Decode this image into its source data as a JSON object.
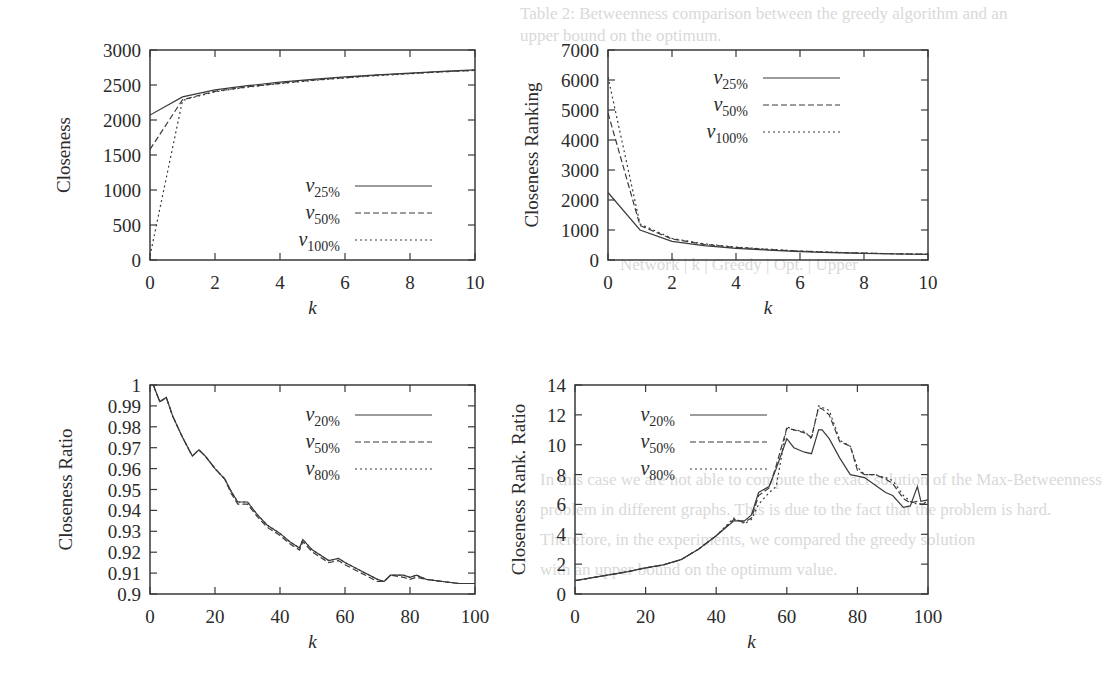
{
  "background_text": [
    {
      "text": "Table 2: Betweenness comparison between the greedy algorithm and an",
      "x": 520,
      "y": 4
    },
    {
      "text": "upper bound on the optimum.",
      "x": 520,
      "y": 26
    },
    {
      "text": "Network | k | Greedy | Opt. | Upper",
      "x": 620,
      "y": 255
    },
    {
      "text": "In this case we are not able to compute the exact solution of the Max-Betweenness",
      "x": 540,
      "y": 470
    },
    {
      "text": "problem in different graphs. This is due to the fact that the problem is hard.",
      "x": 540,
      "y": 500
    },
    {
      "text": "Therefore, in the experiments, we compared the greedy solution",
      "x": 540,
      "y": 530
    },
    {
      "text": "with an upper bound on the optimum value.",
      "x": 540,
      "y": 560
    }
  ],
  "chart_data": [
    {
      "id": "closeness",
      "type": "line",
      "title": "",
      "xlabel": "k",
      "ylabel": "Closeness",
      "xlim": [
        0,
        10
      ],
      "ylim": [
        0,
        3000
      ],
      "xticks": [
        0,
        2,
        4,
        6,
        8,
        10
      ],
      "yticks": [
        0,
        500,
        1000,
        1500,
        2000,
        2500,
        3000
      ],
      "grid": false,
      "legend_position": "lower-right",
      "frame": {
        "x0": 150,
        "y0": 50,
        "x1": 475,
        "y1": 260
      },
      "x": [
        0,
        1,
        2,
        3,
        4,
        5,
        6,
        7,
        8,
        9,
        10
      ],
      "series": [
        {
          "name": "v25%",
          "base": "v",
          "sub": "25%",
          "style": "solid",
          "values": [
            2070,
            2330,
            2430,
            2490,
            2540,
            2580,
            2615,
            2645,
            2670,
            2695,
            2715
          ]
        },
        {
          "name": "v50%",
          "base": "v",
          "sub": "50%",
          "style": "dashed",
          "values": [
            1580,
            2290,
            2410,
            2475,
            2525,
            2570,
            2605,
            2640,
            2665,
            2690,
            2710
          ]
        },
        {
          "name": "v100%",
          "base": "v",
          "sub": "100%",
          "style": "dotted",
          "values": [
            60,
            2280,
            2405,
            2470,
            2520,
            2565,
            2600,
            2635,
            2660,
            2688,
            2708
          ]
        }
      ]
    },
    {
      "id": "closeness-ranking",
      "type": "line",
      "title": "",
      "xlabel": "k",
      "ylabel": "Closeness Ranking",
      "xlim": [
        0,
        10
      ],
      "ylim": [
        0,
        7000
      ],
      "xticks": [
        0,
        2,
        4,
        6,
        8,
        10
      ],
      "yticks": [
        0,
        1000,
        2000,
        3000,
        4000,
        5000,
        6000,
        7000
      ],
      "grid": false,
      "legend_position": "upper-right",
      "frame": {
        "x0": 608,
        "y0": 50,
        "x1": 928,
        "y1": 260
      },
      "x": [
        0,
        1,
        2,
        3,
        4,
        5,
        6,
        7,
        8,
        9,
        10
      ],
      "series": [
        {
          "name": "v25%",
          "base": "v",
          "sub": "25%",
          "style": "solid",
          "values": [
            2250,
            1000,
            620,
            480,
            390,
            330,
            280,
            245,
            220,
            200,
            185
          ]
        },
        {
          "name": "v50%",
          "base": "v",
          "sub": "50%",
          "style": "dashed",
          "values": [
            4900,
            1150,
            700,
            520,
            420,
            350,
            295,
            255,
            228,
            205,
            190
          ]
        },
        {
          "name": "v100%",
          "base": "v",
          "sub": "100%",
          "style": "dotted",
          "values": [
            6100,
            1200,
            720,
            540,
            430,
            360,
            300,
            260,
            230,
            208,
            192
          ]
        }
      ]
    },
    {
      "id": "closeness-ratio",
      "type": "line",
      "title": "",
      "xlabel": "k",
      "ylabel": "Closeness Ratio",
      "xlim": [
        0,
        100
      ],
      "ylim": [
        0.9,
        1.0
      ],
      "xticks": [
        0,
        20,
        40,
        60,
        80,
        100
      ],
      "yticks": [
        0.9,
        0.91,
        0.92,
        0.93,
        0.94,
        0.95,
        0.96,
        0.97,
        0.98,
        0.99,
        1
      ],
      "ytick_labels": [
        "0.9",
        "0.91",
        "0.92",
        "0.93",
        "0.94",
        "0.95",
        "0.96",
        "0.97",
        "0.98",
        "0.99",
        "1"
      ],
      "grid": false,
      "legend_position": "upper-right",
      "frame": {
        "x0": 150,
        "y0": 385,
        "x1": 475,
        "y1": 594
      },
      "x": [
        1,
        3,
        5,
        7,
        10,
        13,
        15,
        17,
        20,
        23,
        25,
        27,
        30,
        33,
        36,
        40,
        43,
        46,
        47,
        50,
        55,
        58,
        60,
        65,
        70,
        72,
        74,
        78,
        80,
        82,
        85,
        90,
        95,
        100
      ],
      "series": [
        {
          "name": "v20%",
          "base": "v",
          "sub": "20%",
          "style": "solid",
          "values": [
            1.0,
            0.992,
            0.994,
            0.985,
            0.975,
            0.966,
            0.969,
            0.966,
            0.96,
            0.955,
            0.949,
            0.944,
            0.944,
            0.938,
            0.933,
            0.929,
            0.925,
            0.922,
            0.926,
            0.921,
            0.916,
            0.917,
            0.915,
            0.911,
            0.907,
            0.906,
            0.909,
            0.909,
            0.908,
            0.909,
            0.907,
            0.906,
            0.905,
            0.905
          ]
        },
        {
          "name": "v50%",
          "base": "v",
          "sub": "50%",
          "style": "dashed",
          "values": [
            1.0,
            0.992,
            0.994,
            0.985,
            0.975,
            0.966,
            0.969,
            0.966,
            0.96,
            0.955,
            0.948,
            0.943,
            0.943,
            0.937,
            0.932,
            0.928,
            0.924,
            0.921,
            0.925,
            0.92,
            0.915,
            0.916,
            0.914,
            0.91,
            0.906,
            0.906,
            0.909,
            0.908,
            0.907,
            0.908,
            0.907,
            0.906,
            0.905,
            0.905
          ]
        },
        {
          "name": "v80%",
          "base": "v",
          "sub": "80%",
          "style": "dotted",
          "values": [
            1.0,
            0.992,
            0.994,
            0.985,
            0.975,
            0.966,
            0.969,
            0.966,
            0.96,
            0.955,
            0.949,
            0.944,
            0.944,
            0.938,
            0.933,
            0.929,
            0.925,
            0.922,
            0.926,
            0.921,
            0.916,
            0.917,
            0.915,
            0.911,
            0.907,
            0.906,
            0.909,
            0.909,
            0.908,
            0.909,
            0.907,
            0.906,
            0.905,
            0.905
          ]
        }
      ]
    },
    {
      "id": "closeness-rank-ratio",
      "type": "line",
      "title": "",
      "xlabel": "k",
      "ylabel": "Closeness Rank. Ratio",
      "xlim": [
        0,
        100
      ],
      "ylim": [
        0,
        14
      ],
      "xticks": [
        0,
        20,
        40,
        60,
        80,
        100
      ],
      "yticks": [
        0,
        2,
        4,
        6,
        8,
        10,
        12,
        14
      ],
      "grid": false,
      "legend_position": "upper-left",
      "frame": {
        "x0": 575,
        "y0": 385,
        "x1": 928,
        "y1": 594
      },
      "x": [
        0,
        5,
        10,
        15,
        20,
        25,
        30,
        35,
        40,
        45,
        48,
        50,
        52,
        55,
        57,
        60,
        62,
        65,
        67,
        69,
        70,
        72,
        75,
        78,
        80,
        82,
        85,
        88,
        90,
        93,
        95,
        97,
        98,
        100
      ],
      "series": [
        {
          "name": "v20%",
          "base": "v",
          "sub": "20%",
          "style": "solid",
          "values": [
            0.9,
            1.1,
            1.3,
            1.5,
            1.75,
            1.95,
            2.3,
            3.0,
            3.9,
            4.9,
            4.9,
            5.3,
            6.8,
            7.2,
            8.4,
            10.4,
            9.8,
            9.5,
            9.4,
            11.0,
            11.0,
            10.4,
            9.1,
            8.0,
            7.9,
            7.8,
            7.3,
            6.8,
            6.6,
            5.8,
            5.9,
            7.2,
            6.2,
            6.3
          ]
        },
        {
          "name": "v50%",
          "base": "v",
          "sub": "50%",
          "style": "dashed",
          "values": [
            0.9,
            1.1,
            1.3,
            1.5,
            1.75,
            1.95,
            2.3,
            3.0,
            3.9,
            5.0,
            4.8,
            5.1,
            6.6,
            7.1,
            8.6,
            11.1,
            11.0,
            10.8,
            10.5,
            12.5,
            12.4,
            12.0,
            10.2,
            9.9,
            8.3,
            8.0,
            8.0,
            7.7,
            7.4,
            6.4,
            6.1,
            6.2,
            6.0,
            6.1
          ]
        },
        {
          "name": "v80%",
          "base": "v",
          "sub": "80%",
          "style": "dotted",
          "values": [
            0.9,
            1.1,
            1.3,
            1.5,
            1.75,
            1.95,
            2.3,
            3.0,
            3.9,
            5.1,
            4.7,
            5.0,
            6.0,
            6.8,
            7.2,
            11.2,
            11.0,
            10.9,
            10.4,
            12.6,
            12.5,
            12.3,
            10.3,
            9.9,
            8.5,
            8.0,
            8.0,
            7.8,
            7.6,
            6.6,
            6.2,
            6.0,
            6.0,
            6.2
          ]
        }
      ]
    }
  ]
}
